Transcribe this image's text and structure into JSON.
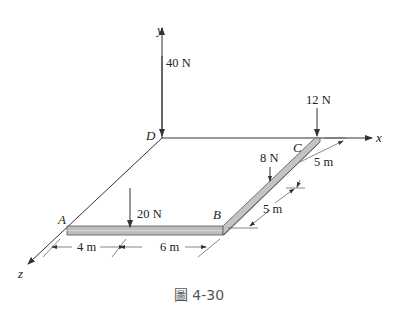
{
  "figure": {
    "caption": "圖 4-30",
    "axes": {
      "x": "x",
      "y": "y",
      "z": "z"
    },
    "points": {
      "A": "A",
      "B": "B",
      "C": "C",
      "D": "D"
    },
    "forces": [
      {
        "id": "f40",
        "label": "40 N",
        "at": "D",
        "direction": "down"
      },
      {
        "id": "f12",
        "label": "12 N",
        "at": "C",
        "direction": "down"
      },
      {
        "id": "f8",
        "label": "8 N",
        "at": "midpoint of BC",
        "direction": "down"
      },
      {
        "id": "f20",
        "label": "20 N",
        "at": "4 m from A on AB",
        "direction": "down"
      }
    ],
    "dimensions": [
      {
        "id": "d4",
        "label": "4 m",
        "segment": "A to 20 N"
      },
      {
        "id": "d6",
        "label": "6 m",
        "segment": "20 N to B"
      },
      {
        "id": "d5a",
        "label": "5 m",
        "segment": "C to 8 N"
      },
      {
        "id": "d5b",
        "label": "5 m",
        "segment": "8 N to B"
      }
    ],
    "colors": {
      "line": "#333333",
      "bar_fill": "#b8b8b8",
      "bar_edge": "#555555",
      "caption": "#555555"
    }
  }
}
